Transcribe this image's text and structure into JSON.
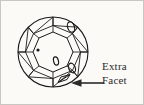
{
  "figure": {
    "background_color": "#fbfaf7",
    "border_color": "#c9c7c2",
    "ink_color": "#1a1a1a"
  },
  "callout": {
    "line1": "Extra",
    "line2": "Facet",
    "full_text": "Extra Facet",
    "arrow_direction": "left",
    "arrow_target": "lower-right girdle area of diamond"
  },
  "diagram": {
    "girdle_circle": {
      "cx": 52,
      "cy": 51,
      "r": 35
    },
    "table_facet": {
      "shape": "octagon",
      "cx": 52,
      "cy": 51,
      "r": 20
    },
    "inclusions": [
      {
        "name": "pinpoint-inclusion",
        "type": "dot",
        "cx": 37,
        "cy": 49,
        "r": 1.6
      },
      {
        "name": "crystal-inclusion-upper-right",
        "type": "oval",
        "cx": 70,
        "cy": 26,
        "rx": 3.4,
        "ry": 5.4,
        "rotate": -18
      },
      {
        "name": "crystal-inclusion-center",
        "type": "oval",
        "cx": 55,
        "cy": 60,
        "rx": 2.4,
        "ry": 4.2,
        "rotate": -14
      },
      {
        "name": "crystal-inclusion-lower-right",
        "type": "oval",
        "cx": 71,
        "cy": 67,
        "rx": 3.2,
        "ry": 5.0,
        "rotate": -22
      }
    ],
    "extra_facet": {
      "name": "extra-facet",
      "location": "lower-right girdle",
      "cx": 63,
      "cy": 79
    }
  }
}
